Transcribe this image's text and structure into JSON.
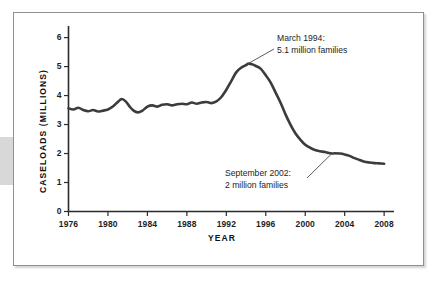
{
  "figure": {
    "frame_border_color": "#8f8f8f",
    "background": "#ffffff",
    "line_color": "#3c3c3c"
  },
  "chart_data": {
    "type": "line",
    "title": "",
    "xlabel": "YEAR",
    "ylabel": "CASELOADS (MILLIONS)",
    "xlim": [
      1976,
      2009
    ],
    "ylim": [
      0,
      6.4
    ],
    "xticks": [
      1976,
      1980,
      1984,
      1988,
      1992,
      1996,
      2000,
      2004,
      2008
    ],
    "xtick_labels": [
      "1976",
      "1980",
      "1984",
      "1988",
      "1992",
      "1996",
      "2000",
      "2004",
      "2008"
    ],
    "yticks": [
      0,
      1,
      2,
      3,
      4,
      5,
      6
    ],
    "ytick_labels": [
      "0",
      "1",
      "2",
      "3",
      "4",
      "5",
      "6"
    ],
    "grid": false,
    "legend": "none",
    "series": [
      {
        "name": "AFDC/TANF caseloads",
        "x": [
          1976.0,
          1976.5,
          1977.0,
          1977.5,
          1978.0,
          1978.5,
          1979.0,
          1979.5,
          1980.0,
          1980.5,
          1981.0,
          1981.4,
          1981.8,
          1982.2,
          1982.6,
          1983.0,
          1983.5,
          1984.0,
          1984.5,
          1985.0,
          1985.5,
          1986.0,
          1986.5,
          1987.0,
          1987.5,
          1988.0,
          1988.5,
          1989.0,
          1989.5,
          1990.0,
          1990.5,
          1991.0,
          1991.5,
          1992.0,
          1992.5,
          1993.0,
          1993.5,
          1994.0,
          1994.2,
          1994.6,
          1995.0,
          1995.5,
          1996.0,
          1996.5,
          1997.0,
          1997.5,
          1998.0,
          1998.5,
          1999.0,
          1999.5,
          2000.0,
          2000.5,
          2001.0,
          2001.5,
          2002.0,
          2002.7,
          2003.0,
          2003.5,
          2004.0,
          2004.5,
          2005.0,
          2005.5,
          2006.0,
          2006.5,
          2007.0,
          2007.5,
          2008.0
        ],
        "y": [
          3.56,
          3.52,
          3.58,
          3.5,
          3.46,
          3.5,
          3.45,
          3.48,
          3.52,
          3.62,
          3.78,
          3.88,
          3.8,
          3.62,
          3.48,
          3.42,
          3.48,
          3.62,
          3.66,
          3.62,
          3.68,
          3.7,
          3.66,
          3.7,
          3.72,
          3.7,
          3.76,
          3.72,
          3.76,
          3.78,
          3.74,
          3.8,
          3.95,
          4.2,
          4.5,
          4.8,
          4.96,
          5.05,
          5.1,
          5.08,
          5.02,
          4.92,
          4.7,
          4.45,
          4.1,
          3.75,
          3.35,
          3.0,
          2.7,
          2.48,
          2.3,
          2.2,
          2.12,
          2.08,
          2.05,
          2.0,
          2.01,
          2.0,
          1.97,
          1.92,
          1.84,
          1.78,
          1.72,
          1.69,
          1.67,
          1.66,
          1.65
        ]
      }
    ],
    "annotations": [
      {
        "id": "peak",
        "line1": "March 1994:",
        "line2": "5.1 million families",
        "point_x": 1994.2,
        "point_y": 5.1
      },
      {
        "id": "trough",
        "line1": "September 2002:",
        "line2": "2 million families",
        "point_x": 2002.7,
        "point_y": 2.0
      }
    ]
  }
}
